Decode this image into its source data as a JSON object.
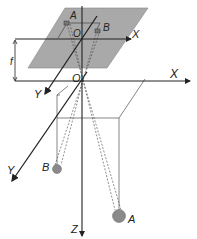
{
  "diagram": {
    "type": "pinhole-camera-projection",
    "labels": {
      "upper_point_a": "A",
      "upper_point_b": "B",
      "upper_origin": "O",
      "upper_x_axis": "X",
      "focal_length": "f",
      "lower_origin": "O",
      "lower_x_axis": "X",
      "upper_y_axis": "Y",
      "lower_y_axis": "Y",
      "z_axis": "Z",
      "ball_b": "B",
      "ball_a": "A"
    },
    "colors": {
      "plane_fill": "#a9a9a9",
      "line": "#222222",
      "ball": "#8a8a8a"
    }
  }
}
